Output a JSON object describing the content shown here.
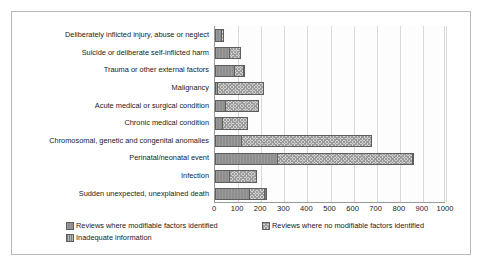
{
  "chart_data": {
    "type": "bar",
    "orientation": "horizontal",
    "stacked": true,
    "title": "",
    "xlabel": "",
    "ylabel": "",
    "xlim": [
      0,
      1000
    ],
    "xticks": [
      "0",
      "100",
      "200",
      "300",
      "400",
      "500",
      "600",
      "700",
      "800",
      "900",
      "1000"
    ],
    "grid": true,
    "legend_position": "bottom",
    "categories": [
      "Deliberately inflicted injury, abuse or neglect",
      "Suicide or deliberate self-inflicted harm",
      "Trauma or other external factors",
      "Malignancy",
      "Acute medical or surgical condition",
      "Chronic medical condition",
      "Chromosomal, genetic and congenital anomalies",
      "Perinatal/neonatal event",
      "Infection",
      "Sudden unexpected, unexplained death"
    ],
    "series": [
      {
        "name": "Reviews where modifiable factors identified",
        "color": "#8e8e8e",
        "values": [
          20,
          55,
          80,
          5,
          40,
          25,
          110,
          265,
          55,
          145
        ]
      },
      {
        "name": "Reviews where no modifiable factors identified",
        "color": "#d2d2d2",
        "values": [
          10,
          50,
          35,
          200,
          140,
          110,
          560,
          585,
          120,
          65
        ]
      },
      {
        "name": "Inadequate information",
        "color": "#b6b6b6",
        "values": [
          0,
          0,
          5,
          0,
          0,
          0,
          0,
          5,
          0,
          5
        ]
      }
    ],
    "totals": [
      30,
      105,
      120,
      205,
      180,
      135,
      670,
      855,
      175,
      215
    ]
  },
  "legend": {
    "items": [
      "Reviews where modifiable factors identified",
      "Reviews where no modifiable factors identified",
      "Inadequate information"
    ]
  }
}
